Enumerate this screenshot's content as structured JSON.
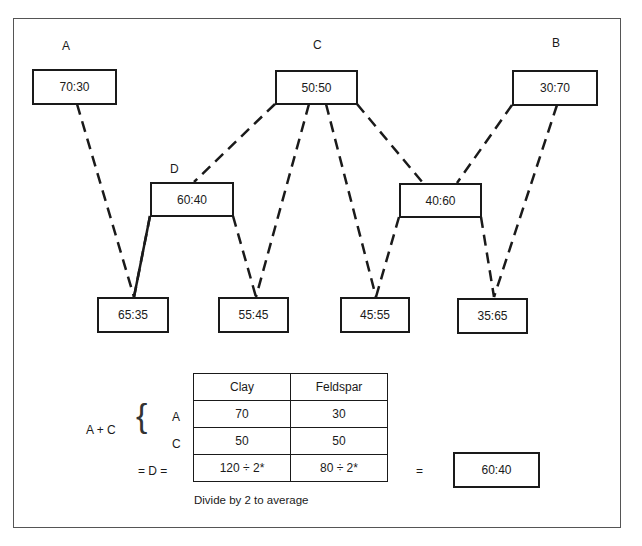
{
  "diagram": {
    "node_labels": {
      "A": "A",
      "B": "B",
      "C": "C",
      "D": "D"
    },
    "nodes": {
      "A": "70:30",
      "C": "50:50",
      "B": "30:70",
      "D": "60:40",
      "CB": "40:60",
      "AD": "65:35",
      "DC": "55:45",
      "CCB": "45:55",
      "CBB": "35:65"
    },
    "edges": [
      [
        "A",
        "AD"
      ],
      [
        "D",
        "AD"
      ],
      [
        "D",
        "DC"
      ],
      [
        "C",
        "DC"
      ],
      [
        "C",
        "D"
      ],
      [
        "C",
        "CCB"
      ],
      [
        "CB",
        "CCB"
      ],
      [
        "C",
        "CB"
      ],
      [
        "B",
        "CB"
      ],
      [
        "CB",
        "CBB"
      ],
      [
        "B",
        "CBB"
      ]
    ]
  },
  "calc": {
    "left_label": "A + C",
    "row_labels": [
      "A",
      "C"
    ],
    "eq_label": "= D =",
    "headers": [
      "Clay",
      "Feldspar"
    ],
    "rows": [
      [
        "70",
        "30"
      ],
      [
        "50",
        "50"
      ],
      [
        "120 ÷ 2*",
        "80 ÷ 2*"
      ]
    ],
    "equals": "=",
    "result": "60:40",
    "footnote": "Divide by 2 to average"
  }
}
